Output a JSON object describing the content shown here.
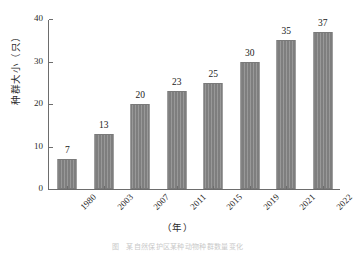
{
  "chart_data": {
    "type": "bar",
    "title": "",
    "subtitle": "",
    "xlabel": "（年）",
    "ylabel": "种群大小（只）",
    "categories": [
      "1980",
      "2003",
      "2007",
      "2011",
      "2015",
      "2019",
      "2021",
      "2022"
    ],
    "values": [
      7,
      13,
      20,
      23,
      25,
      30,
      35,
      37
    ],
    "value_labels": [
      "7",
      "13",
      "20",
      "23",
      "25",
      "30",
      "35",
      "37"
    ],
    "ylim": [
      0,
      40
    ],
    "ytick_labels": [
      "0",
      "10",
      "20",
      "30",
      "40"
    ],
    "ytick_values": [
      0,
      10,
      20,
      30,
      40
    ],
    "grid": false,
    "legend": false,
    "legend_position": "none",
    "bar_color": "#858585",
    "bar_edge_color": "#7a7a7a",
    "axis_color": "#6d6d6d",
    "text_color": "#1a1a1a",
    "background": "#ffffff",
    "xtick_rotation": -45,
    "series": [
      {
        "name": "种群大小",
        "values": [
          7,
          13,
          20,
          23,
          25,
          30,
          35,
          37
        ]
      }
    ]
  },
  "caption": {
    "text": "图　某自然保护区某种动物种群数量变化"
  }
}
